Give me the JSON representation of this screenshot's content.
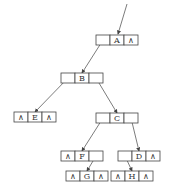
{
  "diagram": {
    "type": "binary-tree-linked-representation",
    "null_symbol": "∧",
    "nodes": [
      {
        "id": "A",
        "left": "B",
        "right": null
      },
      {
        "id": "B",
        "left": "E",
        "right": "C"
      },
      {
        "id": "E",
        "left": null,
        "right": null
      },
      {
        "id": "C",
        "left": "F",
        "right": "D"
      },
      {
        "id": "F",
        "left": null,
        "right": "G"
      },
      {
        "id": "D",
        "left": "H",
        "right": null
      },
      {
        "id": "G",
        "left": null,
        "right": null
      },
      {
        "id": "H",
        "left": null,
        "right": null
      }
    ]
  }
}
